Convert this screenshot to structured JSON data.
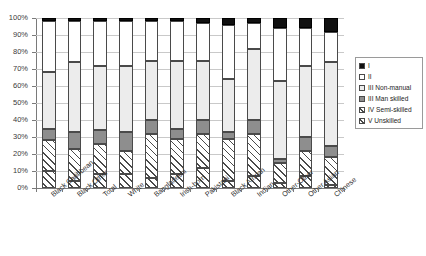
{
  "chart_data": {
    "type": "bar",
    "subtype": "stacked-100-percent",
    "title": "",
    "xlabel": "",
    "ylabel": "",
    "ylim": [
      0,
      100
    ],
    "ytick_labels": [
      "0%",
      "10%",
      "20%",
      "30%",
      "40%",
      "50%",
      "60%",
      "70%",
      "80%",
      "90%",
      "100%"
    ],
    "ytick_values": [
      0,
      10,
      20,
      30,
      40,
      50,
      60,
      70,
      80,
      90,
      100
    ],
    "grid": true,
    "legend_position": "right",
    "categories": [
      "Black Caribbean",
      "Black Other",
      "Total",
      "White",
      "Bangladeshi",
      "Irish-born",
      "Pakistani",
      "Black African",
      "Indian",
      "Other-Other",
      "Other Asian",
      "Chinese"
    ],
    "stack_order_bottom_to_top": [
      "V Unskilled",
      "IV Semi-skilled",
      "III Man skilled",
      "III Non-manual",
      "II",
      "I"
    ],
    "series": [
      {
        "name": "V Unskilled",
        "values": [
          10,
          4,
          8,
          8,
          6,
          8,
          12,
          4,
          7,
          3,
          7,
          2
        ]
      },
      {
        "name": "IV Semi-skilled",
        "values": [
          18,
          19,
          18,
          14,
          26,
          21,
          20,
          25,
          25,
          12,
          15,
          16
        ]
      },
      {
        "name": "III Man skilled",
        "values": [
          7,
          10,
          8,
          11,
          8,
          6,
          8,
          4,
          8,
          2,
          8,
          7
        ]
      },
      {
        "name": "III Non-manual",
        "values": [
          33,
          41,
          38,
          39,
          35,
          40,
          35,
          31,
          42,
          46,
          42,
          49
        ]
      },
      {
        "name": "II",
        "values": [
          30,
          24,
          26,
          26,
          23,
          23,
          22,
          32,
          15,
          31,
          22,
          18
        ]
      },
      {
        "name": "I",
        "values": [
          2,
          2,
          2,
          2,
          2,
          2,
          3,
          4,
          3,
          6,
          6,
          8
        ]
      }
    ],
    "legend_entries": [
      {
        "label": "I",
        "pattern": "solid-black"
      },
      {
        "label": "II",
        "pattern": "white"
      },
      {
        "label": "III Non-manual",
        "pattern": "light-gray"
      },
      {
        "label": "III Man skilled",
        "pattern": "mid-gray"
      },
      {
        "label": "IV Semi-skilled",
        "pattern": "diagonal-hatch"
      },
      {
        "label": "V Unskilled",
        "pattern": "cross-hatch"
      }
    ]
  }
}
